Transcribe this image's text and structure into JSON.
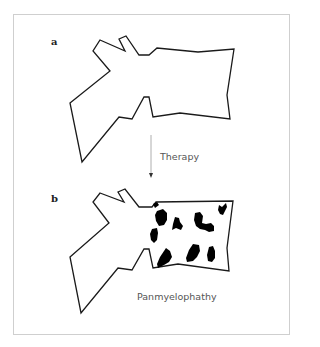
{
  "figure": {
    "panels": [
      {
        "label": "a"
      },
      {
        "label": "b"
      }
    ],
    "arrow_label": "Therapy",
    "caption": "Panmyelophathy",
    "colors": {
      "outline": "#1a1a1a",
      "lesion": "#000000",
      "arrow": "#999999",
      "frame": "#cfcfcf"
    }
  }
}
